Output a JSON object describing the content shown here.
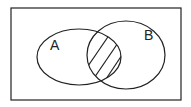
{
  "diagram": {
    "type": "venn",
    "universe": {
      "x": 11,
      "y": 8,
      "width": 170,
      "height": 92
    },
    "sets": [
      {
        "label": "A",
        "cx": 79,
        "cy": 57,
        "rx": 42,
        "ry": 28,
        "label_x": 50,
        "label_y": 50
      },
      {
        "label": "B",
        "cx": 126,
        "cy": 55,
        "rx": 39,
        "ry": 34,
        "label_x": 146,
        "label_y": 40
      }
    ],
    "shaded_region": "A ∩ B",
    "shading_style": "diagonal-hatch",
    "stroke_color": "#222222",
    "background": "#ffffff"
  }
}
